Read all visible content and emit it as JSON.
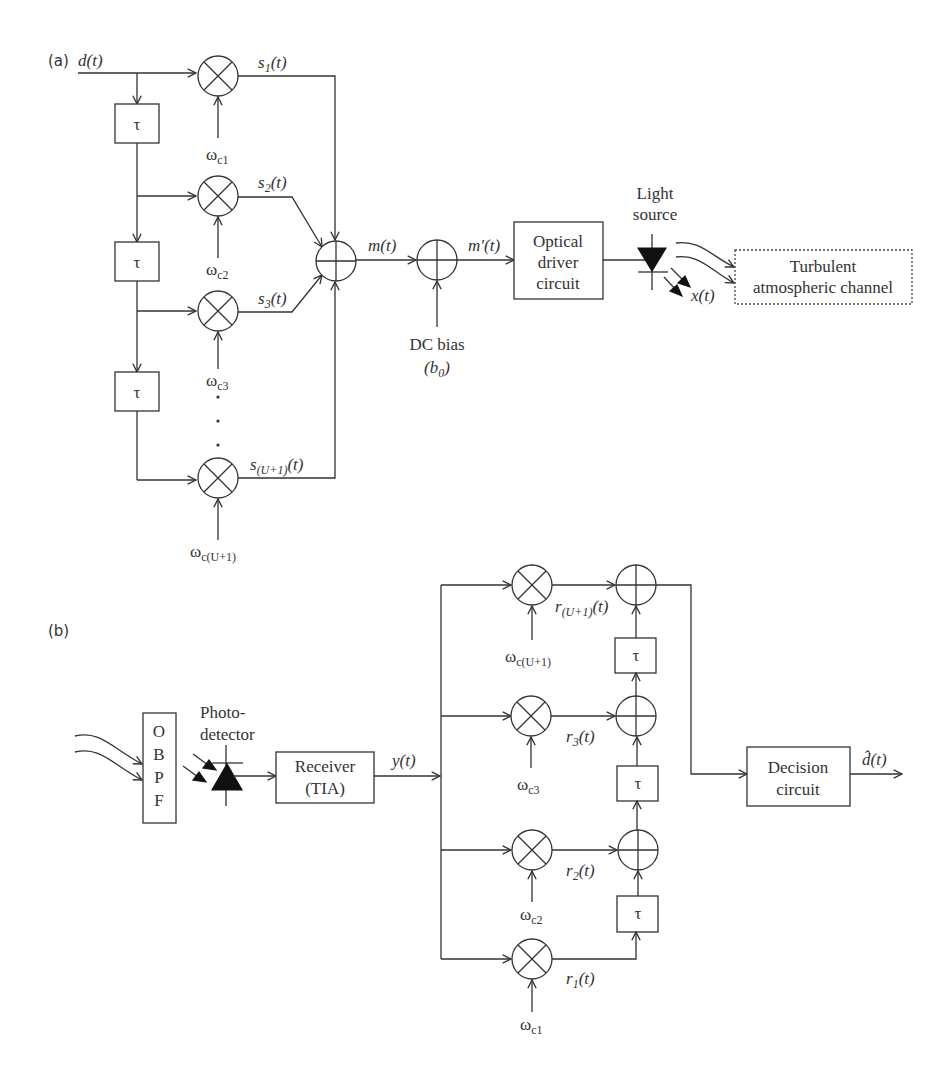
{
  "figure": {
    "part_a": {
      "label": "(a)",
      "input": "d(t)",
      "delay_symbol": "τ",
      "mixers": [
        {
          "signal": "s",
          "signal_sub": "1",
          "carrier": "ω",
          "carrier_sub": "c1"
        },
        {
          "signal": "s",
          "signal_sub": "2",
          "carrier": "ω",
          "carrier_sub": "c2"
        },
        {
          "signal": "s",
          "signal_sub": "3",
          "carrier": "ω",
          "carrier_sub": "c3"
        },
        {
          "signal": "s",
          "signal_sub": "(U+1)",
          "carrier": "ω",
          "carrier_sub": "c(U+1)"
        }
      ],
      "signal_suffix": "(t)",
      "sum_output": "m(t)",
      "biased_output": "m′(t)",
      "dc_bias_label": "DC bias",
      "dc_bias_symbol": "(b",
      "dc_bias_sub": "0",
      "dc_bias_close": ")",
      "driver_box": [
        "Optical",
        "driver",
        "circuit"
      ],
      "light_source_label": [
        "Light",
        "source"
      ],
      "emitted": "x(t)",
      "channel_box": [
        "Turbulent",
        "atmospheric channel"
      ],
      "ellipsis": "·"
    },
    "part_b": {
      "label": "(b)",
      "obpf_letters": [
        "O",
        "B",
        "P",
        "F"
      ],
      "photodetector_label": [
        "Photo-",
        "detector"
      ],
      "receiver_box": [
        "Receiver",
        "(TIA)"
      ],
      "receiver_output": "y(t)",
      "delay_symbol": "τ",
      "branches": [
        {
          "signal": "r",
          "signal_sub": "(U+1)",
          "carrier": "ω",
          "carrier_sub": "c(U+1)"
        },
        {
          "signal": "r",
          "signal_sub": "3",
          "carrier": "ω",
          "carrier_sub": "c3"
        },
        {
          "signal": "r",
          "signal_sub": "2",
          "carrier": "ω",
          "carrier_sub": "c2"
        },
        {
          "signal": "r",
          "signal_sub": "1",
          "carrier": "ω",
          "carrier_sub": "c1"
        }
      ],
      "signal_suffix": "(t)",
      "decision_box": [
        "Decision",
        "circuit"
      ],
      "output": "d̂(t)"
    }
  }
}
